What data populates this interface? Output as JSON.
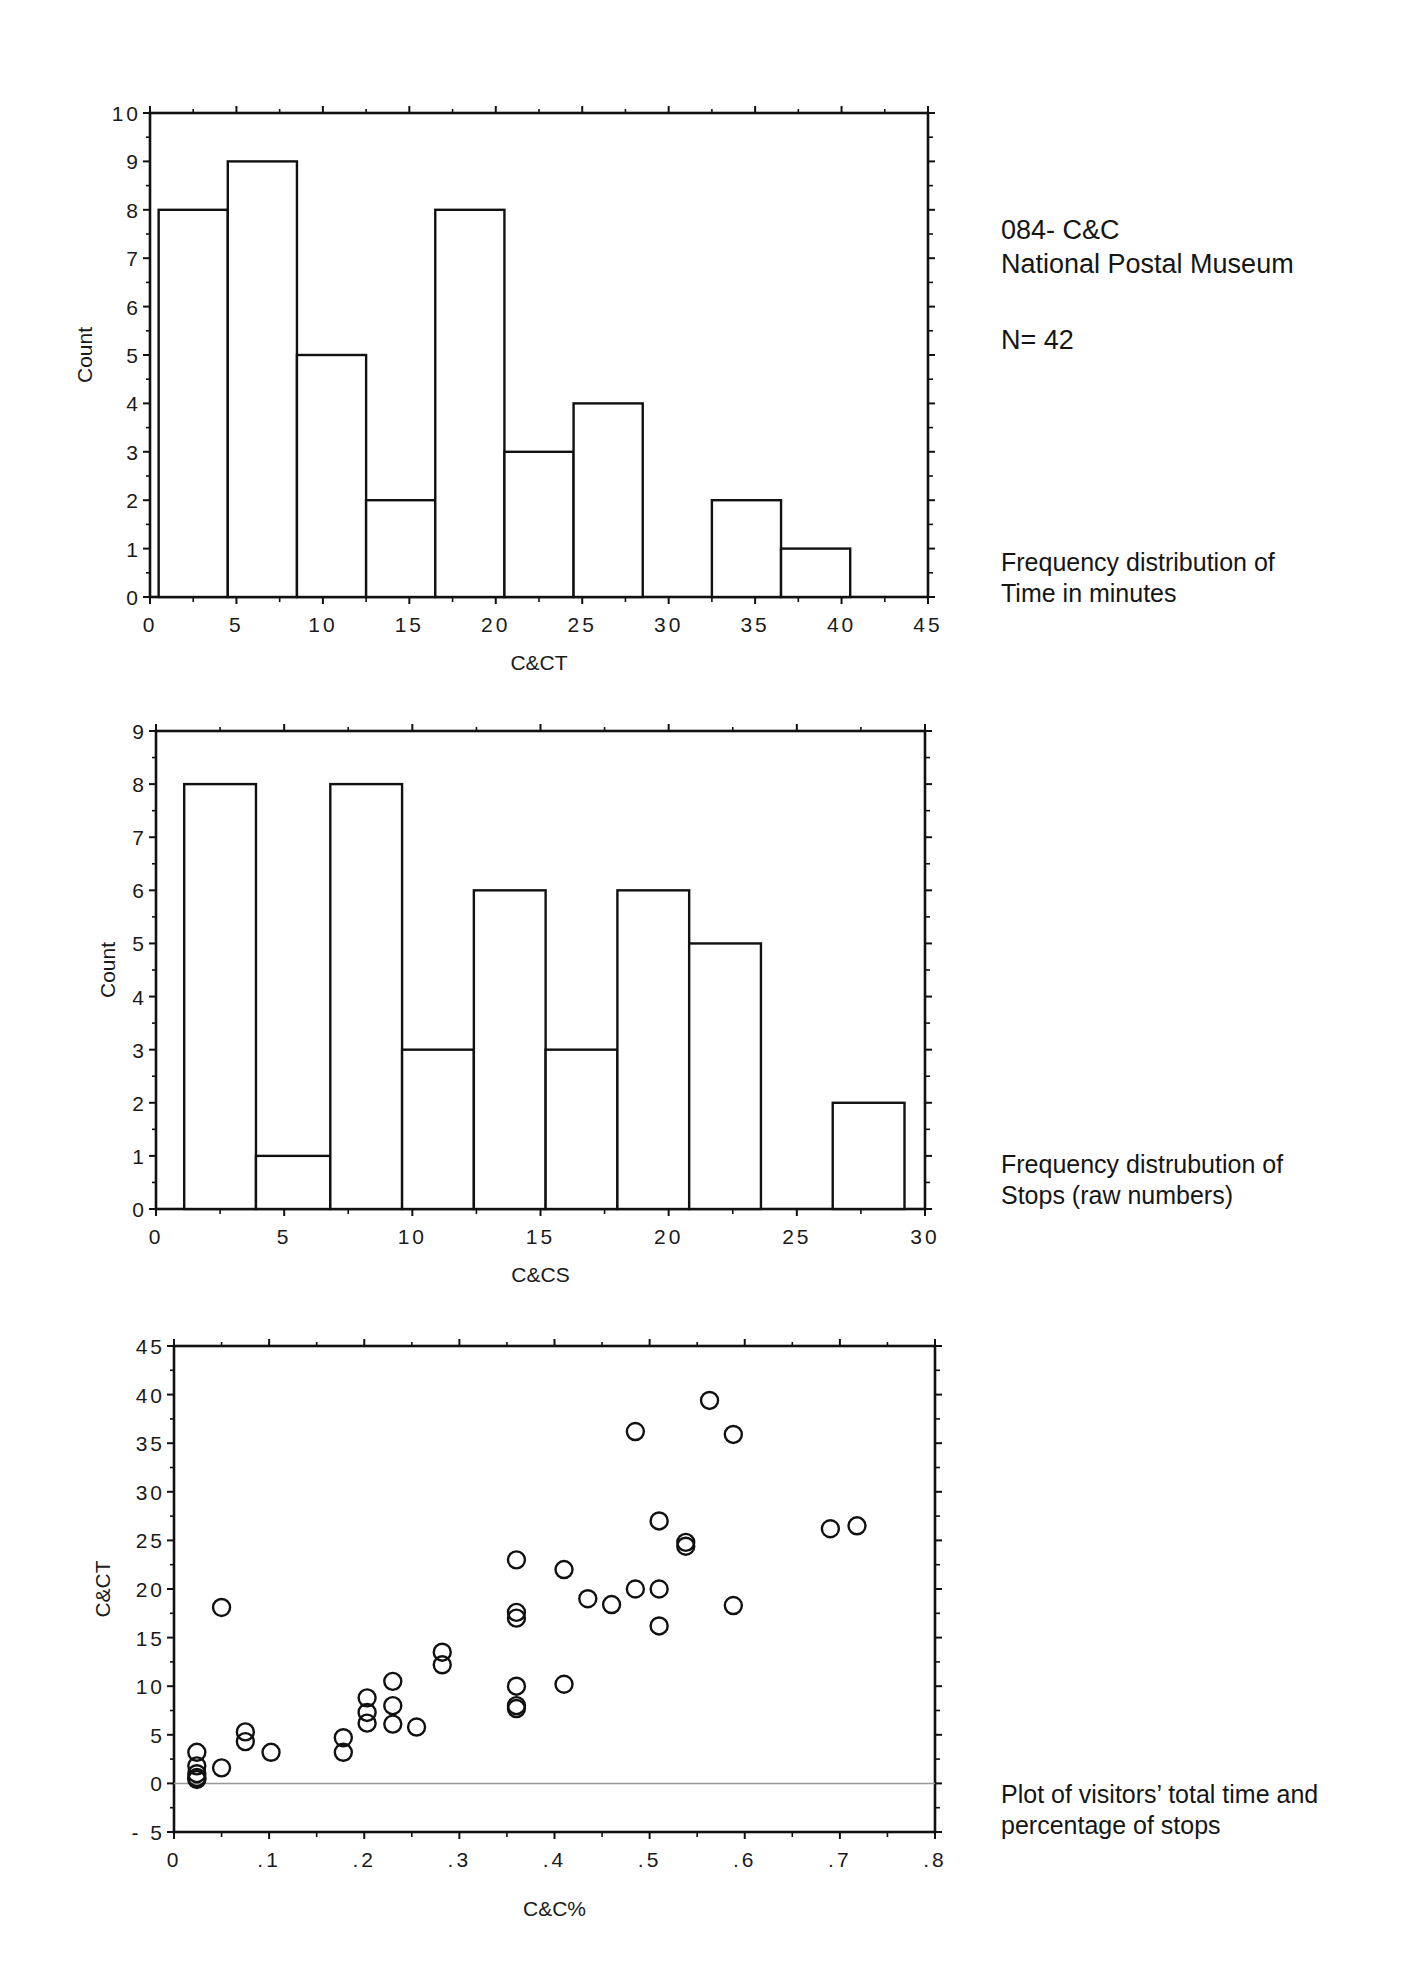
{
  "annotations": {
    "header_line1": "084- C&C",
    "header_line2": "National Postal Museum",
    "n_label": "N= 42",
    "caption_time_1": "Frequency distribution of",
    "caption_time_2": "Time in minutes",
    "caption_stops_1": "Frequency distrubution of",
    "caption_stops_2": "Stops (raw numbers)",
    "caption_scatter_1": "Plot of visitors’ total time and",
    "caption_scatter_2": "percentage of stops"
  },
  "chart_data": [
    {
      "type": "bar",
      "subtype": "histogram",
      "title": "Frequency distribution of Time in minutes",
      "xlabel": "C&CT",
      "ylabel": "Count",
      "xlim": [
        0,
        45
      ],
      "ylim": [
        0,
        10
      ],
      "x_ticks": [
        "0",
        "5",
        "10",
        "15",
        "20",
        "25",
        "30",
        "35",
        "40",
        "45"
      ],
      "y_ticks": [
        "0",
        "1",
        "2",
        "3",
        "4",
        "5",
        "6",
        "7",
        "8",
        "9",
        "10"
      ],
      "bins": [
        [
          0.5,
          4.5
        ],
        [
          4.5,
          8.5
        ],
        [
          8.5,
          12.5
        ],
        [
          12.5,
          16.5
        ],
        [
          16.5,
          20.5
        ],
        [
          20.5,
          24.5
        ],
        [
          24.5,
          28.5
        ],
        [
          28.5,
          32.5
        ],
        [
          32.5,
          36.5
        ],
        [
          36.5,
          40.5
        ]
      ],
      "categories": [
        "0.5-4.5",
        "4.5-8.5",
        "8.5-12.5",
        "12.5-16.5",
        "16.5-20.5",
        "20.5-24.5",
        "24.5-28.5",
        "28.5-32.5",
        "32.5-36.5",
        "36.5-40.5"
      ],
      "values": [
        8,
        9,
        5,
        2,
        8,
        3,
        4,
        0,
        2,
        1
      ],
      "grid": false
    },
    {
      "type": "bar",
      "subtype": "histogram",
      "title": "Frequency distrubution of Stops (raw numbers)",
      "xlabel": "C&CS",
      "ylabel": "Count",
      "xlim": [
        0,
        30
      ],
      "ylim": [
        0,
        9
      ],
      "x_ticks": [
        "0",
        "5",
        "10",
        "15",
        "20",
        "25",
        "30"
      ],
      "y_ticks": [
        "0",
        "1",
        "2",
        "3",
        "4",
        "5",
        "6",
        "7",
        "8",
        "9"
      ],
      "bins": [
        [
          1.1,
          3.9
        ],
        [
          3.9,
          6.8
        ],
        [
          6.8,
          9.6
        ],
        [
          9.6,
          12.4
        ],
        [
          12.4,
          15.2
        ],
        [
          15.2,
          18.0
        ],
        [
          18.0,
          20.8
        ],
        [
          20.8,
          23.6
        ],
        [
          23.6,
          26.4
        ],
        [
          26.4,
          29.2
        ]
      ],
      "categories": [
        "1-4",
        "4-7",
        "7-10",
        "10-12",
        "12-15",
        "15-18",
        "18-21",
        "21-24",
        "24-26",
        "26-29"
      ],
      "values": [
        8,
        1,
        8,
        3,
        6,
        3,
        6,
        5,
        0,
        2
      ],
      "grid": false
    },
    {
      "type": "scatter",
      "title": "Plot of visitors’ total time and percentage of stops",
      "xlabel": "C&C%",
      "ylabel": "C&CT",
      "xlim": [
        0,
        0.8
      ],
      "ylim": [
        -5,
        45
      ],
      "x_ticks": [
        "0",
        ".1",
        ".2",
        ".3",
        ".4",
        ".5",
        ".6",
        ".7",
        ".8"
      ],
      "y_ticks": [
        "- 5",
        "0",
        "5",
        "10",
        "15",
        "20",
        "25",
        "30",
        "35",
        "40",
        "45"
      ],
      "reference_line_y": 0,
      "points": [
        [
          0.024,
          3.2
        ],
        [
          0.024,
          1.8
        ],
        [
          0.024,
          1.0
        ],
        [
          0.024,
          0.6
        ],
        [
          0.024,
          0.4
        ],
        [
          0.05,
          1.6
        ],
        [
          0.05,
          18.1
        ],
        [
          0.075,
          5.3
        ],
        [
          0.075,
          4.3
        ],
        [
          0.102,
          3.2
        ],
        [
          0.178,
          4.7
        ],
        [
          0.178,
          3.2
        ],
        [
          0.203,
          8.8
        ],
        [
          0.203,
          7.3
        ],
        [
          0.203,
          6.2
        ],
        [
          0.23,
          10.5
        ],
        [
          0.23,
          8.0
        ],
        [
          0.23,
          6.1
        ],
        [
          0.255,
          5.8
        ],
        [
          0.282,
          13.5
        ],
        [
          0.282,
          12.2
        ],
        [
          0.36,
          23.0
        ],
        [
          0.36,
          17.6
        ],
        [
          0.36,
          17.0
        ],
        [
          0.36,
          10.0
        ],
        [
          0.36,
          8.0
        ],
        [
          0.36,
          7.7
        ],
        [
          0.41,
          22.0
        ],
        [
          0.41,
          10.2
        ],
        [
          0.435,
          19.0
        ],
        [
          0.46,
          18.4
        ],
        [
          0.485,
          36.2
        ],
        [
          0.485,
          20.0
        ],
        [
          0.51,
          27.0
        ],
        [
          0.51,
          20.0
        ],
        [
          0.51,
          16.2
        ],
        [
          0.538,
          24.8
        ],
        [
          0.538,
          24.4
        ],
        [
          0.563,
          39.4
        ],
        [
          0.588,
          35.9
        ],
        [
          0.588,
          18.3
        ],
        [
          0.69,
          26.2
        ],
        [
          0.718,
          26.5
        ]
      ],
      "marker": "open-circle",
      "grid": false
    }
  ]
}
